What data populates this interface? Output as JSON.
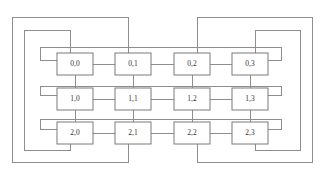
{
  "diagram": {
    "type": "torus-mesh",
    "rows": 3,
    "cols": 4,
    "background_color": "#ffffff",
    "line_color": "#8e8e8e",
    "node_border_color": "#7a7a7a",
    "node_fill_color": "#ffffff",
    "label_color": "#333333",
    "nodes": [
      {
        "id": "n-0-0",
        "label": "0,0",
        "row": 0,
        "col": 0,
        "x": 57,
        "y": 53
      },
      {
        "id": "n-0-1",
        "label": "0,1",
        "row": 0,
        "col": 1,
        "x": 115,
        "y": 53
      },
      {
        "id": "n-0-2",
        "label": "0,2",
        "row": 0,
        "col": 2,
        "x": 174,
        "y": 53
      },
      {
        "id": "n-0-3",
        "label": "0,3",
        "row": 0,
        "col": 3,
        "x": 232,
        "y": 53
      },
      {
        "id": "n-1-0",
        "label": "1,0",
        "row": 1,
        "col": 0,
        "x": 57,
        "y": 88
      },
      {
        "id": "n-1-1",
        "label": "1,1",
        "row": 1,
        "col": 1,
        "x": 115,
        "y": 88
      },
      {
        "id": "n-1-2",
        "label": "1,2",
        "row": 1,
        "col": 2,
        "x": 174,
        "y": 88
      },
      {
        "id": "n-1-3",
        "label": "1,3",
        "row": 1,
        "col": 3,
        "x": 232,
        "y": 88
      },
      {
        "id": "n-2-0",
        "label": "2,0",
        "row": 2,
        "col": 0,
        "x": 57,
        "y": 122
      },
      {
        "id": "n-2-1",
        "label": "2,1",
        "row": 2,
        "col": 1,
        "x": 115,
        "y": 122
      },
      {
        "id": "n-2-2",
        "label": "2,2",
        "row": 2,
        "col": 2,
        "x": 174,
        "y": 122
      },
      {
        "id": "n-2-3",
        "label": "2,3",
        "row": 2,
        "col": 3,
        "x": 232,
        "y": 122
      }
    ],
    "node_width": 36,
    "node_height": 22,
    "row_links": [
      {
        "name": "row-0-link-0-1",
        "d": "M 93 64 L 115 64"
      },
      {
        "name": "row-0-link-1-2",
        "d": "M 151 64 L 174 64"
      },
      {
        "name": "row-0-link-2-3",
        "d": "M 210 64 L 232 64"
      },
      {
        "name": "row-1-link-0-1",
        "d": "M 93 99 L 115 99"
      },
      {
        "name": "row-1-link-1-2",
        "d": "M 151 99 L 174 99"
      },
      {
        "name": "row-1-link-2-3",
        "d": "M 210 99 L 232 99"
      },
      {
        "name": "row-2-link-0-1",
        "d": "M 93 133 L 115 133"
      },
      {
        "name": "row-2-link-1-2",
        "d": "M 151 133 L 174 133"
      },
      {
        "name": "row-2-link-2-3",
        "d": "M 210 133 L 232 133"
      }
    ],
    "col_links": [
      {
        "name": "col-0-link-0-1",
        "d": "M 75 75 L 75 88"
      },
      {
        "name": "col-0-link-1-2",
        "d": "M 75 110 L 75 122"
      },
      {
        "name": "col-1-link-0-1",
        "d": "M 133 75 L 133 88"
      },
      {
        "name": "col-1-link-1-2",
        "d": "M 133 110 L 133 122"
      },
      {
        "name": "col-2-link-0-1",
        "d": "M 192 75 L 192 88"
      },
      {
        "name": "col-2-link-1-2",
        "d": "M 192 110 L 192 122"
      },
      {
        "name": "col-3-link-0-1",
        "d": "M 250 75 L 250 88"
      },
      {
        "name": "col-3-link-1-2",
        "d": "M 250 110 L 250 122"
      }
    ],
    "row_wrap_links": [
      {
        "name": "row-0-wraparound",
        "d": "M 57 60 L 40 60 L 40 47 L 281 47 L 281 60 L 268 60"
      },
      {
        "name": "row-1-wraparound",
        "d": "M 57 95 L 40 95 L 40 86 L 281 86 L 281 95 L 268 95"
      },
      {
        "name": "row-2-wraparound",
        "d": "M 57 129 L 40 129 L 40 119 L 281 119 L 281 129 L 268 129"
      }
    ],
    "col_wrap_links": [
      {
        "name": "col-0-wraparound",
        "d": "M 70 53 L 70 30 L 24 30 L 24 150 L 70 150 L 70 144"
      },
      {
        "name": "col-1-wraparound",
        "d": "M 128 53 L 128 17 L 12 17 L 12 162 L 128 162 L 128 144"
      },
      {
        "name": "col-2-wraparound",
        "d": "M 197 53 L 197 17 L 312 17 L 312 162 L 197 162 L 197 144"
      },
      {
        "name": "col-3-wraparound",
        "d": "M 255 53 L 255 30 L 300 30 L 300 150 L 255 150 L 255 144"
      }
    ]
  }
}
